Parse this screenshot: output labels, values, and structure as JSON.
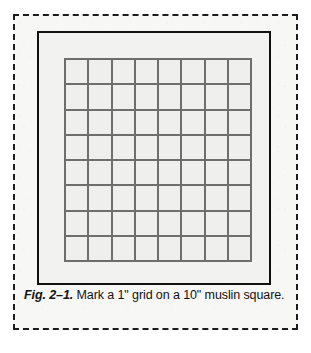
{
  "figure": {
    "caption": {
      "figure_number": "Fig. 2–1.",
      "text": " Mark a 1\" grid on a 10\" muslin square."
    },
    "muslin_square": {
      "label": "10\" muslin square",
      "size_inches": 10
    },
    "grid": {
      "label": "1\" grid",
      "columns": 8,
      "rows": 8,
      "cell_size_inches": 1,
      "cells": [
        [
          "",
          "",
          "",
          "",
          "",
          "",
          "",
          ""
        ],
        [
          "",
          "",
          "",
          "",
          "",
          "",
          "",
          ""
        ],
        [
          "",
          "",
          "",
          "",
          "",
          "",
          "",
          ""
        ],
        [
          "",
          "",
          "",
          "",
          "",
          "",
          "",
          ""
        ],
        [
          "",
          "",
          "",
          "",
          "",
          "",
          "",
          ""
        ],
        [
          "",
          "",
          "",
          "",
          "",
          "",
          "",
          ""
        ],
        [
          "",
          "",
          "",
          "",
          "",
          "",
          "",
          ""
        ],
        [
          "",
          "",
          "",
          "",
          "",
          "",
          "",
          ""
        ]
      ]
    },
    "colors": {
      "page_background": "#ffffff",
      "plate_background": "#f7f7f5",
      "dashed_frame_line": "#1c1c1c",
      "square_border": "#111111",
      "square_fill": "#f2f2f0",
      "grid_line": "#6e6e6e",
      "grid_cell_fill": "#efefed",
      "caption_text": "#121212"
    }
  }
}
